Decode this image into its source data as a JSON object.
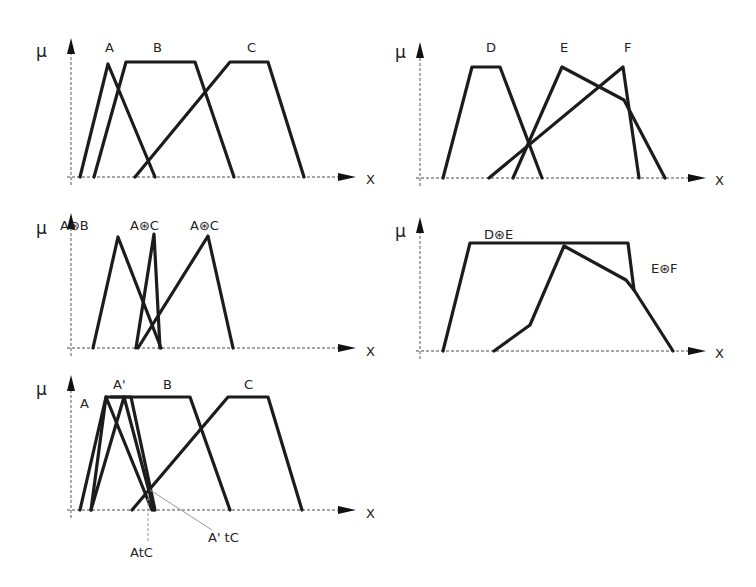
{
  "figure": {
    "axis_labels": {
      "y": "μ",
      "x": "X"
    },
    "operator_symbol": "⊛"
  },
  "panels": [
    {
      "id": "top-left",
      "title": "Fuzzy sets A, B, C",
      "labels": [
        {
          "text": "A",
          "x": 105,
          "y": 52
        },
        {
          "text": "B",
          "x": 153,
          "y": 52
        },
        {
          "text": "C",
          "x": 247,
          "y": 52
        }
      ],
      "sets": [
        {
          "name": "A",
          "points": [
            [
              80,
              177
            ],
            [
              108,
              64
            ],
            [
              155,
              177
            ]
          ]
        },
        {
          "name": "B",
          "points": [
            [
              94,
              177
            ],
            [
              126,
              62
            ],
            [
              195,
              62
            ],
            [
              234,
              177
            ]
          ]
        },
        {
          "name": "C",
          "points": [
            [
              135,
              177
            ],
            [
              230,
              62
            ],
            [
              268,
              62
            ],
            [
              304,
              177
            ]
          ]
        }
      ]
    },
    {
      "id": "top-right",
      "title": "Fuzzy sets D, E, F",
      "labels": [
        {
          "text": "D",
          "x": 486,
          "y": 52
        },
        {
          "text": "E",
          "x": 560,
          "y": 52
        },
        {
          "text": "F",
          "x": 624,
          "y": 52
        }
      ],
      "sets": [
        {
          "name": "D",
          "points": [
            [
              443,
              178
            ],
            [
              472,
              67
            ],
            [
              500,
              67
            ],
            [
              542,
              178
            ]
          ]
        },
        {
          "name": "E",
          "points": [
            [
              513,
              178
            ],
            [
              562,
              67
            ],
            [
              624,
              100
            ],
            [
              665,
              178
            ]
          ]
        },
        {
          "name": "F",
          "points": [
            [
              489,
              178
            ],
            [
              623,
              67
            ],
            [
              639,
              178
            ]
          ]
        }
      ]
    },
    {
      "id": "mid-left",
      "title": "t-norm combinations of A with B and C",
      "labels": [
        {
          "text": "A⊛B",
          "x": 60,
          "y": 230
        },
        {
          "text": "A⊛C",
          "x": 130,
          "y": 230
        },
        {
          "text": "A⊛C",
          "x": 190,
          "y": 230
        }
      ],
      "sets": [
        {
          "name": "A⊛B",
          "points": [
            [
              93,
              348
            ],
            [
              118,
              237
            ],
            [
              161,
              348
            ]
          ]
        },
        {
          "name": "A⊛C (narrow)",
          "points": [
            [
              136,
              348
            ],
            [
              154,
              234
            ],
            [
              160,
              348
            ]
          ]
        },
        {
          "name": "A⊛C",
          "points": [
            [
              138,
              348
            ],
            [
              208,
              236
            ],
            [
              233,
              348
            ]
          ]
        }
      ]
    },
    {
      "id": "mid-right",
      "title": "t-norm combinations of E with D and F",
      "labels": [
        {
          "text": "D⊛E",
          "x": 484,
          "y": 239
        },
        {
          "text": "E⊛F",
          "x": 651,
          "y": 273
        }
      ],
      "sets": [
        {
          "name": "D⊛E",
          "points": [
            [
              443,
              351
            ],
            [
              470,
              243
            ],
            [
              628,
              243
            ],
            [
              634,
              290
            ],
            [
              673,
              351
            ]
          ]
        },
        {
          "name": "E⊛F",
          "points": [
            [
              494,
              351
            ],
            [
              530,
              325
            ],
            [
              564,
              246
            ],
            [
              626,
              280
            ],
            [
              634,
              290
            ]
          ]
        }
      ]
    },
    {
      "id": "bottom-left",
      "title": "A, A', B, C with t-norm intersection points",
      "labels": [
        {
          "text": "A",
          "x": 80,
          "y": 408
        },
        {
          "text": "A'",
          "x": 113,
          "y": 389
        },
        {
          "text": "B",
          "x": 163,
          "y": 389
        },
        {
          "text": "C",
          "x": 244,
          "y": 389
        }
      ],
      "sets": [
        {
          "name": "A",
          "points": [
            [
              80,
              510
            ],
            [
              106,
              397
            ],
            [
              152,
              510
            ]
          ]
        },
        {
          "name": "A'",
          "points": [
            [
              91,
              510
            ],
            [
              124,
              397
            ],
            [
              154,
              510
            ]
          ]
        },
        {
          "name": "A-right",
          "points": [
            [
              111,
              397
            ],
            [
              131,
              397
            ],
            [
              155,
              510
            ]
          ]
        },
        {
          "name": "B",
          "points": [
            [
              91,
              510
            ],
            [
              106,
              397
            ],
            [
              190,
              397
            ],
            [
              230,
              510
            ]
          ]
        },
        {
          "name": "C",
          "points": [
            [
              132,
              510
            ],
            [
              228,
              397
            ],
            [
              268,
              397
            ],
            [
              302,
              510
            ]
          ]
        }
      ],
      "annotations": [
        {
          "text": "AtC",
          "x": 130,
          "y": 557,
          "target": [
            148,
            493
          ]
        },
        {
          "text": "A' tC",
          "x": 208,
          "y": 542,
          "target": [
            150,
            490
          ]
        }
      ]
    }
  ],
  "axes": [
    {
      "panel": "top-left",
      "origin": [
        71,
        177
      ],
      "y_top": 38,
      "x_end": 356,
      "mu_pos": [
        36,
        57
      ],
      "x_label_pos": [
        366,
        184
      ]
    },
    {
      "panel": "top-right",
      "origin": [
        420,
        178
      ],
      "y_top": 42,
      "x_end": 706,
      "mu_pos": [
        395,
        58
      ],
      "x_label_pos": [
        715,
        185
      ]
    },
    {
      "panel": "mid-left",
      "origin": [
        71,
        348
      ],
      "y_top": 213,
      "x_end": 356,
      "mu_pos": [
        36,
        234
      ],
      "x_label_pos": [
        366,
        356
      ]
    },
    {
      "panel": "mid-right",
      "origin": [
        420,
        351
      ],
      "y_top": 217,
      "x_end": 706,
      "mu_pos": [
        395,
        237
      ],
      "x_label_pos": [
        715,
        358
      ]
    },
    {
      "panel": "bottom-left",
      "origin": [
        71,
        510
      ],
      "y_top": 375,
      "x_end": 356,
      "mu_pos": [
        36,
        395
      ],
      "x_label_pos": [
        366,
        518
      ]
    }
  ]
}
